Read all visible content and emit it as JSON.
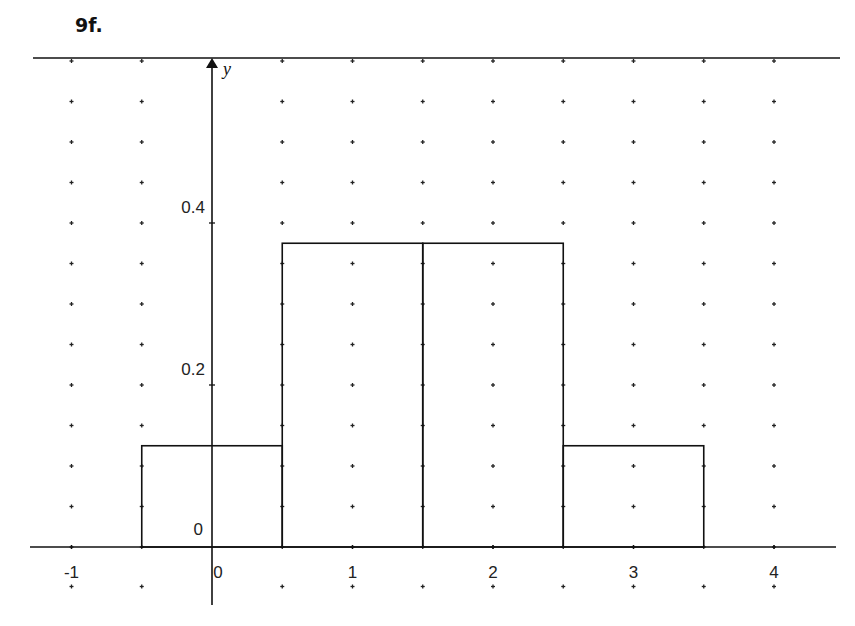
{
  "title": "9f.",
  "colors": {
    "line": "#111111",
    "dot": "#222222",
    "background": "#ffffff"
  },
  "chart_data": {
    "type": "bar",
    "title": "9f.",
    "xlabel": "",
    "ylabel": "y",
    "categories": [
      "0",
      "1",
      "2",
      "3"
    ],
    "bins": [
      [
        -0.5,
        0.5
      ],
      [
        0.5,
        1.5
      ],
      [
        1.5,
        2.5
      ],
      [
        2.5,
        3.5
      ]
    ],
    "values": [
      0.125,
      0.375,
      0.375,
      0.125
    ],
    "xlim": [
      -1.25,
      4.5
    ],
    "ylim": [
      -0.05,
      0.6
    ],
    "x_ticks": [
      -1,
      0,
      1,
      2,
      3,
      4
    ],
    "x_tick_labels": [
      "-1",
      "0",
      "1",
      "2",
      "3",
      "4"
    ],
    "y_ticks": [
      0,
      0.2,
      0.4
    ],
    "y_tick_labels": [
      "0",
      "0.2",
      "0.4"
    ],
    "grid": "dotted points every 0.5 in x and 0.05 in y",
    "legend": null
  }
}
